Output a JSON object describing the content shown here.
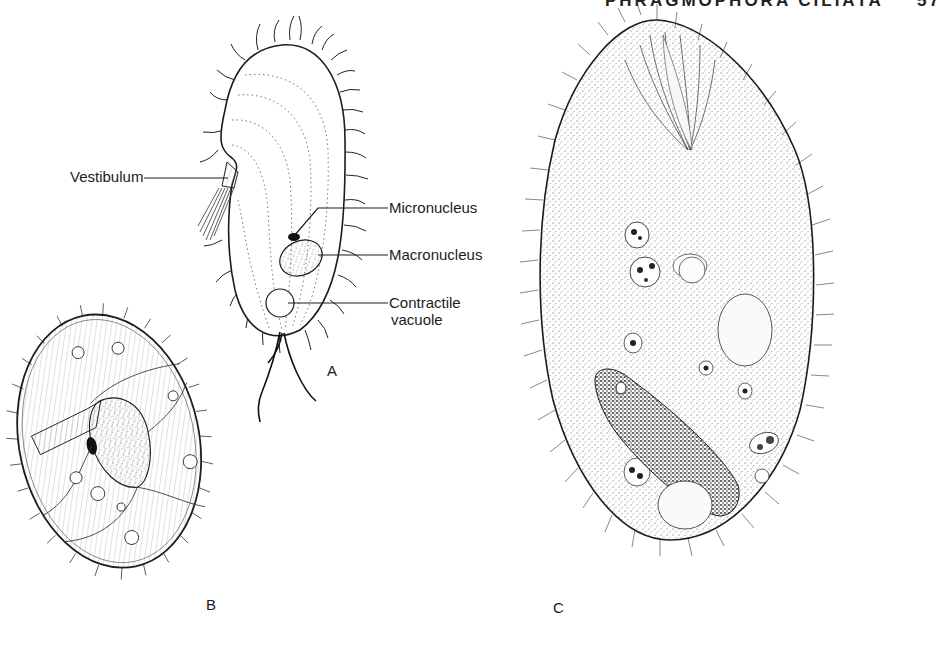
{
  "running_header": {
    "title": "PHRAGMOPHORA CILIATA",
    "page_number": "57",
    "note": "cropped at top edge"
  },
  "figure": {
    "panels": [
      {
        "id": "A",
        "letter": "A",
        "labels": [
          {
            "text": "Vestibulum"
          },
          {
            "text": "Micronucleus"
          },
          {
            "text": "Macronucleus"
          },
          {
            "text": "Contractile",
            "text2": "vacuole"
          }
        ]
      },
      {
        "id": "B",
        "letter": "B"
      },
      {
        "id": "C",
        "letter": "C"
      }
    ]
  },
  "colors": {
    "ink": "#1c1c1c",
    "background": "#ffffff",
    "stipple": "#555555"
  }
}
